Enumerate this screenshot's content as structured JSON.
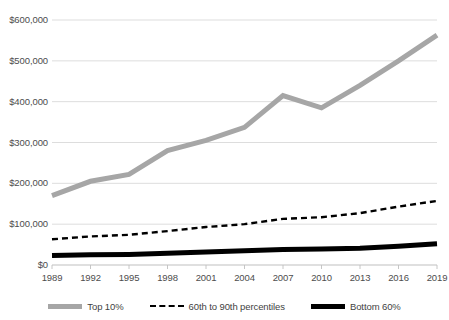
{
  "chart_data": {
    "type": "line",
    "title": "",
    "subtitle": "",
    "xlabel": "",
    "ylabel": "",
    "xlim": [
      1989,
      2019
    ],
    "ylim": [
      0,
      600000
    ],
    "grid": true,
    "legend_position": "bottom",
    "y_ticks": [
      0,
      100000,
      200000,
      300000,
      400000,
      500000,
      600000
    ],
    "y_tick_labels": [
      "$0",
      "$100,000",
      "$200,000",
      "$300,000",
      "$400,000",
      "$500,000",
      "$600,000"
    ],
    "x_ticks": [
      1989,
      1992,
      1995,
      1998,
      2001,
      2004,
      2007,
      2010,
      2013,
      2016,
      2019
    ],
    "x_tick_labels": [
      "1989",
      "1992",
      "1995",
      "1998",
      "2001",
      "2004",
      "2007",
      "2010",
      "2013",
      "2016",
      "2019"
    ],
    "x": [
      1989,
      1992,
      1995,
      1998,
      2001,
      2004,
      2007,
      2010,
      2013,
      2016,
      2019
    ],
    "series": [
      {
        "name": "Top 10%",
        "style": "solid",
        "color": "#a6a6a6",
        "width": 5,
        "values": [
          170000,
          205000,
          222000,
          280000,
          305000,
          337000,
          415000,
          385000,
          440000,
          500000,
          563000
        ]
      },
      {
        "name": "60th to 90th percentiles",
        "style": "dashed",
        "color": "#000000",
        "width": 2.4,
        "values": [
          63000,
          70000,
          74000,
          83000,
          93000,
          100000,
          113000,
          117000,
          127000,
          143000,
          157000
        ]
      },
      {
        "name": "Bottom 60%",
        "style": "solid",
        "color": "#000000",
        "width": 5,
        "values": [
          23000,
          25000,
          26000,
          29000,
          32000,
          35000,
          38000,
          39000,
          41000,
          46000,
          52000
        ]
      }
    ],
    "colors": {
      "gridline": "#d9d9d9",
      "axis": "#bfbfbf",
      "tick_text": "#4d4d4d",
      "top10": "#a6a6a6",
      "mid": "#000000",
      "bottom60": "#000000",
      "background": "#ffffff"
    },
    "legend": [
      {
        "label": "Top 10%",
        "icon": "line-swatch-gray"
      },
      {
        "label": "60th to 90th percentiles",
        "icon": "dashed-line-swatch-black"
      },
      {
        "label": "Bottom 60%",
        "icon": "line-swatch-black"
      }
    ]
  }
}
